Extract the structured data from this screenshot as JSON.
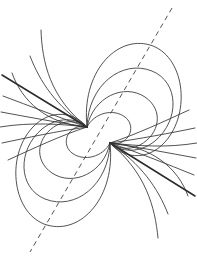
{
  "figure": {
    "background_color": "#ffffff",
    "width": 197,
    "height": 259
  },
  "style": {
    "line_color": "#333333",
    "thick_line_color": "#2b2b2b",
    "axis_color": "#555555",
    "line_width": 0.85,
    "thick_line_width": 1.5,
    "axis_width": 1.0,
    "axis_dash_pattern": "5 4"
  },
  "chart_data": {
    "type": "line",
    "xlabel": "",
    "ylabel": "",
    "grid": false,
    "legend": "none",
    "xlim": [
      0,
      197
    ],
    "ylim": [
      0,
      259
    ],
    "poles": [
      {
        "name": "north-pole-focus",
        "x": 87,
        "y": 127
      },
      {
        "name": "south-pole-focus",
        "x": 110,
        "y": 143
      }
    ],
    "axis": {
      "name": "dipole-axis",
      "style": "dashed",
      "x1": 172,
      "y1": 8,
      "x2": 30,
      "y2": 252
    },
    "series": [
      {
        "name": "upper-loop-1",
        "group": "upper-closed-loops",
        "path": "M 87 127 C 94 113 113 108 125 117 C 134 124 132 137 122 142 C 116 145 112 144 110 143"
      },
      {
        "name": "upper-loop-2",
        "group": "upper-closed-loops",
        "path": "M 87 127 C 93 97 124 83 145 97 C 164 110 160 134 140 145 C 128 151 117 148 110 143"
      },
      {
        "name": "upper-loop-3",
        "group": "upper-closed-loops",
        "path": "M 87 127 C 88 85 122 59 152 71 C 179 82 180 120 155 141 C 139 154 120 152 110 143"
      },
      {
        "name": "upper-loop-4",
        "group": "upper-closed-loops",
        "path": "M 87 127 C 81 73 116 35 150 45 C 184 55 192 112 165 142 C 146 163 121 157 110 143"
      },
      {
        "name": "lower-loop-1",
        "group": "lower-closed-loops",
        "path": "M 110 143 C 103 157 84 162 72 153 C 63 146 65 133 75 128 C 81 125 85 126 87 127"
      },
      {
        "name": "lower-loop-2",
        "group": "lower-closed-loops",
        "path": "M 110 143 C 104 173 73 187 52 173 C 33 160 37 136 57 125 C 69 119 80 122 87 127"
      },
      {
        "name": "lower-loop-3",
        "group": "lower-closed-loops",
        "path": "M 110 143 C 109 185 75 211 45 199 C 18 188 17 150 42 129 C 58 116 77 118 87 127"
      },
      {
        "name": "lower-loop-4",
        "group": "lower-closed-loops",
        "path": "M 110 143 C 116 197 81 235 47 225 C 13 215 5 158 32 128 C 51 107 76 113 87 127"
      },
      {
        "name": "open-line-upper-left-straight",
        "group": "open-field-lines",
        "style": "thick",
        "path": "M 2 75 L 87 127"
      },
      {
        "name": "open-line-left-curved",
        "group": "open-field-lines",
        "path": "M 0 127 C 30 122 62 124 87 127"
      },
      {
        "name": "open-line-upper-left-tall",
        "group": "open-field-lines",
        "path": "M 41 30 C 42 62 50 98 87 127"
      },
      {
        "name": "open-line-upper-left-mid",
        "group": "open-field-lines",
        "path": "M 30 56 C 40 82 56 106 87 127"
      },
      {
        "name": "open-line-left-fan-1",
        "group": "open-field-lines",
        "path": "M 3 96 C 30 106 60 118 87 127"
      },
      {
        "name": "open-line-left-fan-2",
        "group": "open-field-lines",
        "path": "M 1 112 C 28 117 60 123 87 127"
      },
      {
        "name": "open-line-left-fan-3",
        "group": "open-field-lines",
        "path": "M 2 143 C 26 138 58 131 87 127"
      },
      {
        "name": "open-line-left-fan-4",
        "group": "open-field-lines",
        "path": "M 8 160 C 32 149 62 135 87 127"
      },
      {
        "name": "open-line-lower-right-straight",
        "group": "open-field-lines",
        "style": "thick",
        "path": "M 195 196 L 110 143"
      },
      {
        "name": "open-line-right-curved",
        "group": "open-field-lines",
        "path": "M 197 143 C 167 148 138 146 110 143"
      },
      {
        "name": "open-line-lower-right-tall",
        "group": "open-field-lines",
        "path": "M 158 238 C 155 207 146 173 110 143"
      },
      {
        "name": "open-line-lower-right-mid",
        "group": "open-field-lines",
        "path": "M 168 214 C 158 188 141 164 110 143"
      },
      {
        "name": "open-line-right-fan-1",
        "group": "open-field-lines",
        "path": "M 194 175 C 167 164 137 152 110 143"
      },
      {
        "name": "open-line-right-fan-2",
        "group": "open-field-lines",
        "path": "M 196 158 C 169 153 137 147 110 143"
      },
      {
        "name": "open-line-right-fan-3",
        "group": "open-field-lines",
        "path": "M 195 128 C 171 133 139 139 110 143"
      },
      {
        "name": "open-line-right-fan-4",
        "group": "open-field-lines",
        "path": "M 189 110 C 165 121 135 135 110 143"
      },
      {
        "name": "open-line-upper-right-far",
        "group": "open-field-lines",
        "path": "M 188 196 C 178 168 152 146 110 143"
      },
      {
        "name": "open-line-lower-left-far",
        "group": "open-field-lines",
        "path": "M 12 73 C 22 101 46 124 87 127"
      }
    ]
  }
}
